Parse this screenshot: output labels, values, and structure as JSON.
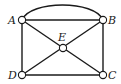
{
  "diagram": {
    "type": "graph",
    "nodes": [
      {
        "id": "A",
        "label": "A",
        "x": 22,
        "y": 20
      },
      {
        "id": "B",
        "label": "B",
        "x": 103,
        "y": 20
      },
      {
        "id": "C",
        "label": "C",
        "x": 103,
        "y": 75
      },
      {
        "id": "D",
        "label": "D",
        "x": 22,
        "y": 75
      },
      {
        "id": "E",
        "label": "E",
        "x": 63,
        "y": 48
      }
    ],
    "edges": [
      {
        "from": "A",
        "to": "B",
        "shape": "straight"
      },
      {
        "from": "A",
        "to": "B",
        "shape": "arc"
      },
      {
        "from": "A",
        "to": "D",
        "shape": "straight"
      },
      {
        "from": "B",
        "to": "C",
        "shape": "straight"
      },
      {
        "from": "D",
        "to": "C",
        "shape": "straight"
      },
      {
        "from": "A",
        "to": "E",
        "shape": "straight"
      },
      {
        "from": "E",
        "to": "C",
        "shape": "straight"
      },
      {
        "from": "B",
        "to": "E",
        "shape": "straight"
      },
      {
        "from": "E",
        "to": "D",
        "shape": "straight"
      }
    ]
  }
}
